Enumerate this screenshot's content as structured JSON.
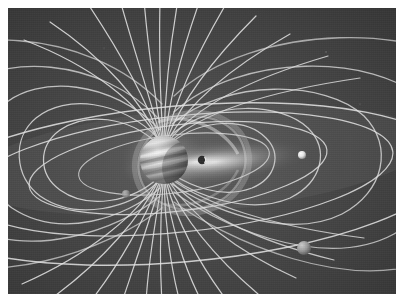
{
  "figure": {
    "medium": "grayscale scientific illustration",
    "caption": "",
    "plate": {
      "x": 8,
      "y": 8,
      "width": 388,
      "height": 286,
      "background_color": "#3d3d3d",
      "page_background_color": "#ffffff"
    }
  },
  "colors": {
    "page_background": "#ffffff",
    "space_background_dark": "#383838",
    "space_background_mid": "#454545",
    "space_background_light": "#4f4f4f",
    "field_line": "#d8d8d8",
    "field_line_dim": "#9a9a9a",
    "orbit_line": "#e8e8e8",
    "plasma_glow": "#f2f2f2",
    "torus": "#c8c8c8",
    "planet_light": "#f0f0f0",
    "planet_mid": "#b4b4b4",
    "planet_dark": "#6a6a6a",
    "moon_bright": "#fdfdfd",
    "moon_dim": "#8e8e8e",
    "moon_silhouette": "#2a2a2a"
  },
  "scene": {
    "planet": {
      "name": "Jupiter",
      "label": "jupiter-planet",
      "center_x": 156,
      "center_y": 152,
      "radius": 24,
      "band_count": 7,
      "tilt_degrees": -12
    },
    "plasma_sheet": {
      "label": "plasma-sheet-glow",
      "center_x": 205,
      "center_y": 154,
      "extent_x": 100,
      "extent_y": 22,
      "brightness": "high"
    },
    "io_plasma_torus": {
      "label": "io-plasma-torus",
      "center_x": 185,
      "center_y": 155,
      "radius_x": 58,
      "radius_y": 50,
      "tilt_degrees": -10
    },
    "magnetic_field": {
      "polar_lines_north": 13,
      "polar_lines_south": 13,
      "closed_loops_left": 5,
      "closed_loops_right": 5,
      "dipole_axis_tilt_degrees": -10
    },
    "orbits": [
      {
        "label": "orbit-inner",
        "semi_major": 95,
        "semi_minor": 30
      },
      {
        "label": "orbit-middle",
        "semi_major": 150,
        "semi_minor": 44
      },
      {
        "label": "orbit-outer",
        "semi_major": 215,
        "semi_minor": 58
      },
      {
        "label": "orbit-outermost",
        "semi_major": 270,
        "semi_minor": 78
      }
    ],
    "moons": [
      {
        "label": "moon-inner-silhouette",
        "x": 194,
        "y": 152,
        "radius": 4,
        "brightness": "silhouette"
      },
      {
        "label": "moon-left",
        "x": 118,
        "y": 186,
        "radius": 4,
        "brightness": "dim"
      },
      {
        "label": "moon-right-bright",
        "x": 294,
        "y": 147,
        "radius": 4,
        "brightness": "bright"
      },
      {
        "label": "moon-lower-right",
        "x": 296,
        "y": 240,
        "radius": 7,
        "brightness": "mid"
      }
    ]
  }
}
